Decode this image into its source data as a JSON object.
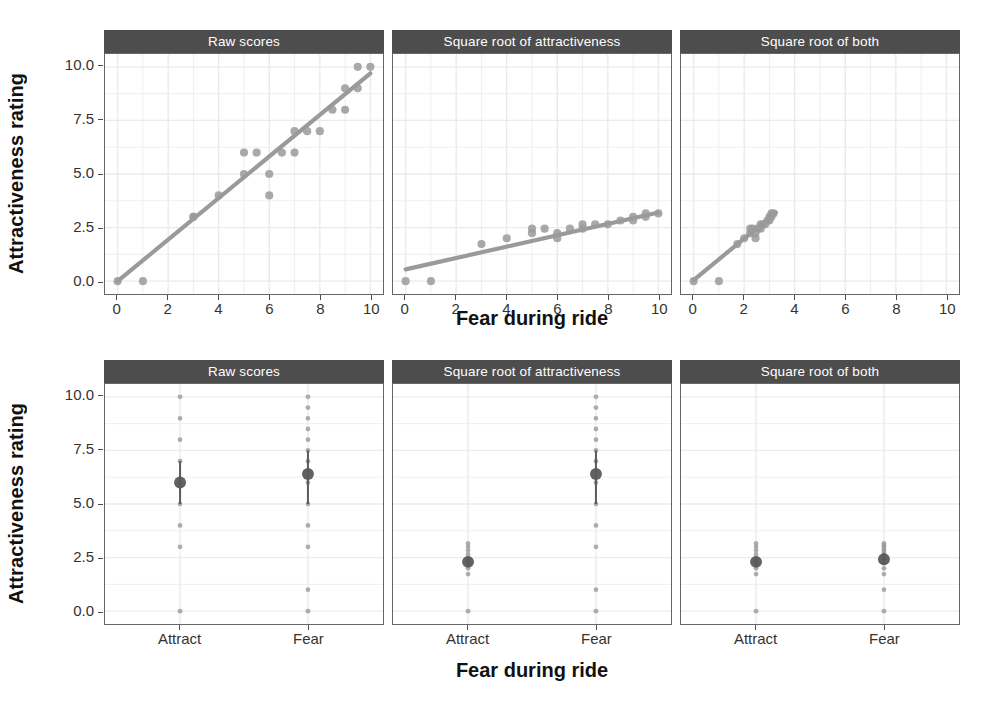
{
  "figure": {
    "background": "#ffffff",
    "point_color": "#9a9a9a",
    "line_color": "#9a9a9a",
    "mean_color": "#595959",
    "strip_bg": "#4d4d4d",
    "strip_fg": "#ffffff",
    "grid_color": "#ebebeb",
    "axis_color": "#666666"
  },
  "axis_titles": {
    "y": "Attractiveness rating",
    "x": "Fear during ride"
  },
  "strips": {
    "raw": "Raw scores",
    "sqrt_attract": "Square root of attractiveness",
    "sqrt_both": "Square root of both"
  },
  "y_ticks": [
    "0.0",
    "2.5",
    "5.0",
    "7.5",
    "10.0"
  ],
  "x_ticks": [
    "0",
    "2",
    "4",
    "6",
    "8",
    "10"
  ],
  "category_ticks": [
    "Attract",
    "Fear"
  ],
  "chart_data": [
    {
      "id": "top-raw",
      "type": "scatter",
      "title": "Raw scores",
      "xlabel": "Fear during ride",
      "ylabel": "Attractiveness rating",
      "xlim": [
        -0.5,
        10.5
      ],
      "ylim": [
        -0.6,
        10.6
      ],
      "xticks": [
        0,
        2,
        4,
        6,
        8,
        10
      ],
      "yticks": [
        0.0,
        2.5,
        5.0,
        7.5,
        10.0
      ],
      "grid": true,
      "legend": "none",
      "points": [
        [
          0,
          0
        ],
        [
          1,
          0
        ],
        [
          3,
          3
        ],
        [
          3,
          3
        ],
        [
          4,
          4
        ],
        [
          5,
          5
        ],
        [
          5,
          6
        ],
        [
          5.5,
          6
        ],
        [
          6,
          5
        ],
        [
          6,
          4
        ],
        [
          6.5,
          6
        ],
        [
          7,
          7
        ],
        [
          7,
          6
        ],
        [
          7.5,
          7
        ],
        [
          8,
          7
        ],
        [
          8.5,
          8
        ],
        [
          9,
          9
        ],
        [
          9,
          8
        ],
        [
          9.5,
          10
        ],
        [
          9.5,
          9
        ],
        [
          10,
          10
        ]
      ],
      "fit_line": {
        "x0": 0,
        "y0": 0.0,
        "x1": 10,
        "y1": 9.7
      }
    },
    {
      "id": "top-sqrt-attract",
      "type": "scatter",
      "title": "Square root of attractiveness",
      "xlabel": "Fear during ride",
      "ylabel": "Attractiveness rating",
      "xlim": [
        -0.5,
        10.5
      ],
      "ylim": [
        -0.6,
        10.6
      ],
      "xticks": [
        0,
        2,
        4,
        6,
        8,
        10
      ],
      "yticks": [
        0.0,
        2.5,
        5.0,
        7.5,
        10.0
      ],
      "grid": true,
      "legend": "none",
      "points": [
        [
          0,
          0
        ],
        [
          1,
          0
        ],
        [
          3,
          1.73
        ],
        [
          4,
          2.0
        ],
        [
          5,
          2.24
        ],
        [
          5,
          2.45
        ],
        [
          5.5,
          2.45
        ],
        [
          6,
          2.24
        ],
        [
          6,
          2.0
        ],
        [
          6.5,
          2.45
        ],
        [
          7,
          2.65
        ],
        [
          7,
          2.45
        ],
        [
          7.5,
          2.65
        ],
        [
          8,
          2.65
        ],
        [
          8.5,
          2.83
        ],
        [
          9,
          3.0
        ],
        [
          9,
          2.83
        ],
        [
          9.5,
          3.16
        ],
        [
          9.5,
          3.0
        ],
        [
          10,
          3.16
        ]
      ],
      "fit_line": {
        "x0": 0,
        "y0": 0.55,
        "x1": 10,
        "y1": 3.2
      }
    },
    {
      "id": "top-sqrt-both",
      "type": "scatter",
      "title": "Square root of both",
      "xlabel": "Fear during ride",
      "ylabel": "Attractiveness rating",
      "xlim": [
        -0.5,
        10.5
      ],
      "ylim": [
        -0.6,
        10.6
      ],
      "xticks": [
        0,
        2,
        4,
        6,
        8,
        10
      ],
      "yticks": [
        0.0,
        2.5,
        5.0,
        7.5,
        10.0
      ],
      "grid": true,
      "legend": "none",
      "points": [
        [
          0,
          0
        ],
        [
          1,
          0
        ],
        [
          1.73,
          1.73
        ],
        [
          2.0,
          2.0
        ],
        [
          2.24,
          2.24
        ],
        [
          2.24,
          2.45
        ],
        [
          2.35,
          2.45
        ],
        [
          2.45,
          2.24
        ],
        [
          2.45,
          2.0
        ],
        [
          2.55,
          2.45
        ],
        [
          2.65,
          2.65
        ],
        [
          2.65,
          2.45
        ],
        [
          2.74,
          2.65
        ],
        [
          2.83,
          2.65
        ],
        [
          2.92,
          2.83
        ],
        [
          3.0,
          3.0
        ],
        [
          3.0,
          2.83
        ],
        [
          3.08,
          3.16
        ],
        [
          3.08,
          3.0
        ],
        [
          3.16,
          3.16
        ]
      ],
      "fit_line": {
        "x0": 0,
        "y0": 0.05,
        "x1": 3.25,
        "y1": 3.2
      }
    },
    {
      "id": "bottom-raw",
      "type": "scatter",
      "title": "Raw scores",
      "xlabel": "Fear during ride",
      "ylabel": "Attractiveness rating",
      "categories": [
        "Attract",
        "Fear"
      ],
      "ylim": [
        -0.6,
        10.6
      ],
      "yticks": [
        0.0,
        2.5,
        5.0,
        7.5,
        10.0
      ],
      "grid": true,
      "legend": "none",
      "groups": [
        {
          "name": "Attract",
          "raw_points": [
            10,
            9,
            8,
            7,
            6,
            5,
            4,
            3,
            0
          ],
          "mean": 6.0,
          "ci": [
            5.0,
            7.0
          ]
        },
        {
          "name": "Fear",
          "raw_points": [
            10,
            9.5,
            9,
            8.5,
            8,
            7.5,
            7,
            6,
            5,
            4,
            3,
            1,
            0
          ],
          "mean": 6.4,
          "ci": [
            5.0,
            7.5
          ]
        }
      ]
    },
    {
      "id": "bottom-sqrt-attract",
      "type": "scatter",
      "title": "Square root of attractiveness",
      "xlabel": "Fear during ride",
      "ylabel": "Attractiveness rating",
      "categories": [
        "Attract",
        "Fear"
      ],
      "ylim": [
        -0.6,
        10.6
      ],
      "yticks": [
        0.0,
        2.5,
        5.0,
        7.5,
        10.0
      ],
      "grid": true,
      "legend": "none",
      "groups": [
        {
          "name": "Attract",
          "raw_points": [
            3.16,
            3.0,
            2.83,
            2.65,
            2.45,
            2.24,
            2.0,
            1.73,
            0
          ],
          "mean": 2.3,
          "ci": [
            2.1,
            2.55
          ]
        },
        {
          "name": "Fear",
          "raw_points": [
            10,
            9.5,
            9,
            8.5,
            8,
            7.5,
            7,
            6,
            5,
            4,
            3,
            1,
            0
          ],
          "mean": 6.4,
          "ci": [
            5.0,
            7.5
          ]
        }
      ]
    },
    {
      "id": "bottom-sqrt-both",
      "type": "scatter",
      "title": "Square root of both",
      "xlabel": "Fear during ride",
      "ylabel": "Attractiveness rating",
      "categories": [
        "Attract",
        "Fear"
      ],
      "ylim": [
        -0.6,
        10.6
      ],
      "yticks": [
        0.0,
        2.5,
        5.0,
        7.5,
        10.0
      ],
      "grid": true,
      "legend": "none",
      "groups": [
        {
          "name": "Attract",
          "raw_points": [
            3.16,
            3.0,
            2.83,
            2.65,
            2.45,
            2.24,
            2.0,
            1.73,
            0
          ],
          "mean": 2.3,
          "ci": [
            2.1,
            2.55
          ]
        },
        {
          "name": "Fear",
          "raw_points": [
            3.16,
            3.08,
            3.0,
            2.92,
            2.83,
            2.74,
            2.65,
            2.45,
            2.24,
            2.0,
            1.73,
            1.0,
            0
          ],
          "mean": 2.42,
          "ci": [
            2.15,
            2.7
          ]
        }
      ]
    }
  ]
}
